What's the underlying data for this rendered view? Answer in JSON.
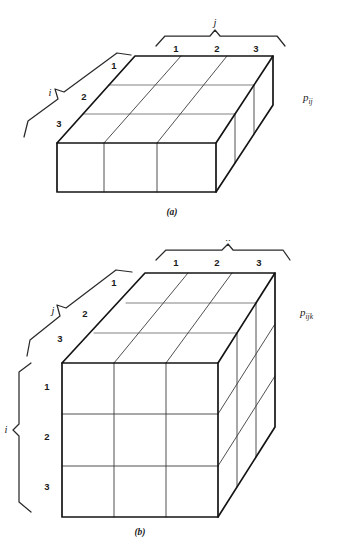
{
  "document": {
    "title": "Three-dimensional probability array diagrams"
  },
  "figures": [
    {
      "id": "a",
      "caption": "(a)",
      "array_label": "p",
      "array_subscript": "ij",
      "dimensions": "3 x 3 slab (two-way table)",
      "top_axis": {
        "name": "j",
        "ticks": [
          "1",
          "2",
          "3"
        ]
      },
      "left_axis": {
        "name": "i",
        "ticks": [
          "1",
          "2",
          "3"
        ]
      }
    },
    {
      "id": "b",
      "caption": "(b)",
      "array_label": "p",
      "array_subscript": "ijk",
      "dimensions": "3 x 3 x 3 cube (three-way table)",
      "top_axis": {
        "name": "k",
        "ticks": [
          "1",
          "2",
          "3"
        ]
      },
      "depth_axis": {
        "name": "j",
        "ticks": [
          "1",
          "2",
          "3"
        ]
      },
      "left_axis": {
        "name": "i",
        "ticks": [
          "1",
          "2",
          "3"
        ]
      }
    }
  ],
  "colors": {
    "ink": "#141414",
    "grid": "#3c3c3c",
    "background": "#ffffff"
  }
}
